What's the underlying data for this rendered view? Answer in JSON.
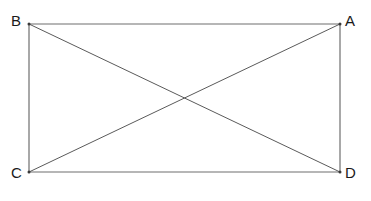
{
  "figure": {
    "background_color": "#ffffff",
    "line_color": "#6e6e6e",
    "diagonal_color": "#5a5a5a",
    "label_color": "#1a1a1a",
    "stroke_width": 1,
    "vertices": [
      {
        "id": "B",
        "label": "B",
        "x": 29,
        "y": 24,
        "label_x": 11,
        "label_y": 13
      },
      {
        "id": "A",
        "label": "A",
        "x": 340,
        "y": 24,
        "label_x": 345,
        "label_y": 13
      },
      {
        "id": "C",
        "label": "C",
        "x": 29,
        "y": 172,
        "label_x": 11,
        "label_y": 165
      },
      {
        "id": "D",
        "label": "D",
        "x": 340,
        "y": 172,
        "label_x": 345,
        "label_y": 165
      }
    ],
    "edges": [
      {
        "name": "top-edge-BA",
        "from": "B",
        "to": "A"
      },
      {
        "name": "right-edge-AD",
        "from": "A",
        "to": "D"
      },
      {
        "name": "bottom-edge-CD",
        "from": "C",
        "to": "D"
      },
      {
        "name": "left-edge-BC",
        "from": "B",
        "to": "C"
      }
    ],
    "diagonals": [
      {
        "name": "diagonal-BD",
        "from": "B",
        "to": "D"
      },
      {
        "name": "diagonal-CA",
        "from": "C",
        "to": "A"
      }
    ],
    "intersection": {
      "name": "diagonal-intersection",
      "x": 184.5,
      "y": 98
    }
  }
}
